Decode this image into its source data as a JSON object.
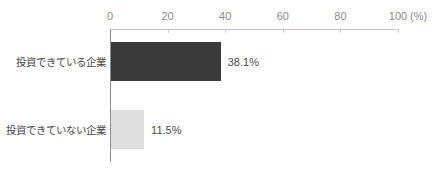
{
  "chart_data": {
    "type": "bar",
    "orientation": "horizontal",
    "categories": [
      "投資できている企業",
      "投資できていない企業"
    ],
    "values": [
      38.1,
      11.5
    ],
    "value_labels": [
      "38.1%",
      "11.5%"
    ],
    "bar_colors": [
      "#3a3a3a",
      "#dedede"
    ],
    "xlim": [
      0,
      100
    ],
    "x_ticks": [
      "0",
      "20",
      "40",
      "60",
      "80",
      "100"
    ],
    "x_unit": "(%)",
    "axis_position": "top",
    "grid": false,
    "legend": false
  },
  "colors": {
    "background": "#ffffff",
    "axis_line": "#c4c4c4",
    "y_baseline": "#8f8f8f",
    "tick_text": "#8a8a8a",
    "category_text": "#4a4a4a",
    "value_text": "#4a4a4a"
  }
}
